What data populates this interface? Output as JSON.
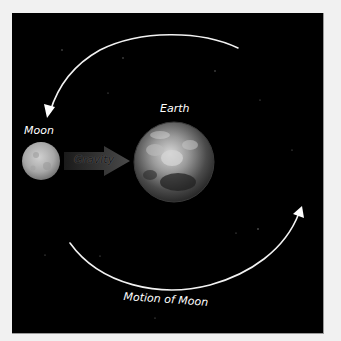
{
  "diagram": {
    "background_color": "#000000",
    "margin_color": "#f1f1f1",
    "labels": {
      "earth": "Earth",
      "moon": "Moon",
      "gravity": "Gravity",
      "motion": "Motion of Moon"
    },
    "nodes": [
      {
        "id": "moon",
        "label": "Moon",
        "shape": "sphere",
        "cx": 41,
        "cy": 161,
        "r": 19,
        "color": "#b0b0b0"
      },
      {
        "id": "earth",
        "label": "Earth",
        "shape": "sphere",
        "cx": 174,
        "cy": 162,
        "r": 40,
        "color": "#8a8a8a"
      }
    ],
    "edges": [
      {
        "from": "moon",
        "to": "earth",
        "label": "Gravity",
        "style": "thick-arrow",
        "color": "#3a3a3a"
      },
      {
        "id": "orbit-top",
        "label": "",
        "style": "curved-arrow",
        "direction": "counterclockwise",
        "color": "#ffffff"
      },
      {
        "id": "orbit-bottom",
        "label": "Motion of Moon",
        "style": "curved-arrow",
        "direction": "counterclockwise",
        "color": "#ffffff"
      }
    ]
  }
}
